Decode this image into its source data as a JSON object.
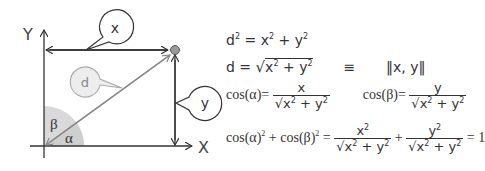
{
  "diagram": {
    "axis_x_label": "X",
    "axis_y_label": "Y",
    "callout_x": "x",
    "callout_y": "y",
    "callout_d": "d",
    "angle_alpha": "α",
    "angle_beta": "β",
    "colors": {
      "line": "#333333",
      "vector": "#888888",
      "sector": "#d9d9d9",
      "point": "#999999",
      "callout_d_fill": "#ededed"
    }
  },
  "equations": {
    "eq1": {
      "lhs": "d",
      "lhs_exp": "2",
      "eq": "=",
      "t1": "x",
      "t1_exp": "2",
      "plus": "+",
      "t2": "y",
      "t2_exp": "2"
    },
    "eq2": {
      "lhs": "d",
      "eq": "=",
      "rad": "√",
      "t1": "x",
      "t1_exp": "2",
      "plus": "+",
      "t2": "y",
      "t2_exp": "2",
      "equiv": "≡",
      "norm": "‖x, y‖"
    },
    "eq3": {
      "left": {
        "fn": "cos(α)",
        "eq": "=",
        "num": "x",
        "den_t1": "x",
        "den_exp1": "2",
        "den_plus": "+",
        "den_t2": "y",
        "den_exp2": "2"
      },
      "right": {
        "fn": "cos(β)",
        "eq": "=",
        "num": "y",
        "den_t1": "x",
        "den_exp1": "2",
        "den_plus": "+",
        "den_t2": "y",
        "den_exp2": "2"
      }
    },
    "eq4": {
      "lhs_a": "cos(α)",
      "lhs_a_exp": "2",
      "plus": "+",
      "lhs_b": "cos(β)",
      "lhs_b_exp": "2",
      "eq": "=",
      "f1_num": "x",
      "f1_num_exp": "2",
      "f2_num": "y",
      "f2_num_exp": "2",
      "den_t1": "x",
      "den_exp1": "2",
      "den_plus": "+",
      "den_t2": "y",
      "den_exp2": "2",
      "plus2": "+",
      "eq2": "=",
      "result": "1"
    }
  }
}
